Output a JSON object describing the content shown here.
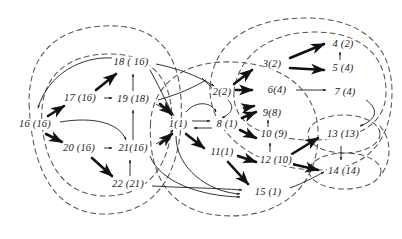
{
  "figure": {
    "width": 402,
    "height": 239,
    "background_color": "#ffffff",
    "stroke_color": "#1a1a1a",
    "dashed_color": "#555555"
  },
  "nodes": [
    {
      "id": "1",
      "label": "1(1)",
      "x": 178,
      "y": 124
    },
    {
      "id": "2",
      "label": "2(2)",
      "x": 222,
      "y": 92
    },
    {
      "id": "3",
      "label": "3(2)",
      "x": 272,
      "y": 64
    },
    {
      "id": "4",
      "label": "4 (2)",
      "x": 343,
      "y": 44
    },
    {
      "id": "5",
      "label": "5 (4)",
      "x": 343,
      "y": 68
    },
    {
      "id": "6",
      "label": "6(4)",
      "x": 277,
      "y": 90
    },
    {
      "id": "7",
      "label": "7 (4)",
      "x": 345,
      "y": 92
    },
    {
      "id": "8",
      "label": "8 (1)",
      "x": 227,
      "y": 124
    },
    {
      "id": "9",
      "label": "9(8)",
      "x": 272,
      "y": 113
    },
    {
      "id": "10",
      "label": "10 (9)",
      "x": 274,
      "y": 134
    },
    {
      "id": "11",
      "label": "11(1)",
      "x": 222,
      "y": 152
    },
    {
      "id": "12",
      "label": "12 (10)",
      "x": 276,
      "y": 160
    },
    {
      "id": "13",
      "label": "13  (13)",
      "x": 343,
      "y": 134
    },
    {
      "id": "14",
      "label": "14 (14)",
      "x": 344,
      "y": 171
    },
    {
      "id": "15",
      "label": "15 (1)",
      "x": 268,
      "y": 192
    },
    {
      "id": "16",
      "label": "16 (16)",
      "x": 35,
      "y": 124
    },
    {
      "id": "17",
      "label": "17 (16)",
      "x": 80,
      "y": 98
    },
    {
      "id": "18",
      "label": "18 ( 16)",
      "x": 131,
      "y": 62
    },
    {
      "id": "19",
      "label": "19 (18)",
      "x": 133,
      "y": 99
    },
    {
      "id": "20",
      "label": "20 (16)",
      "x": 79,
      "y": 148
    },
    {
      "id": "21",
      "label": "21(16)",
      "x": 133,
      "y": 148
    },
    {
      "id": "22",
      "label": "22 (21)",
      "x": 128,
      "y": 184
    }
  ],
  "edges_bold": [
    {
      "from": "16",
      "to": "17"
    },
    {
      "from": "17",
      "to": "18"
    },
    {
      "from": "16",
      "to": "20"
    },
    {
      "from": "20",
      "to": "22"
    },
    {
      "from": "3",
      "to": "4"
    },
    {
      "from": "3",
      "to": "5"
    },
    {
      "from": "2",
      "to": "3"
    },
    {
      "from": "8",
      "to": "9"
    },
    {
      "from": "8",
      "to": "10"
    },
    {
      "from": "1",
      "to": "11"
    },
    {
      "from": "11",
      "to": "12"
    },
    {
      "from": "11",
      "to": "15"
    },
    {
      "from": "12",
      "to": "13"
    },
    {
      "from": "12",
      "to": "14"
    }
  ],
  "edges_thin": [
    {
      "from": "17",
      "to": "19"
    },
    {
      "from": "20",
      "to": "21"
    },
    {
      "from": "21",
      "to": "19"
    },
    {
      "from": "19",
      "to": "18"
    },
    {
      "from": "22",
      "to": "21"
    },
    {
      "from": "6",
      "to": "7"
    },
    {
      "from": "5",
      "to": "4"
    },
    {
      "from": "10",
      "to": "9"
    },
    {
      "from": "12",
      "to": "10"
    },
    {
      "from": "1",
      "to": "8"
    },
    {
      "from": "8",
      "to": "1"
    },
    {
      "from": "13",
      "to": "14"
    }
  ],
  "regions": [
    {
      "name": "left-outer-region",
      "shape": "dashed-ellipse"
    },
    {
      "name": "left-inner-region",
      "shape": "dashed-ellipse"
    },
    {
      "name": "center-region",
      "shape": "dashed-ellipse"
    },
    {
      "name": "right-outer-region",
      "shape": "dashed-ellipse"
    },
    {
      "name": "right-inner-region",
      "shape": "dashed-ellipse"
    },
    {
      "name": "node-13-region",
      "shape": "dashed-ellipse"
    },
    {
      "name": "node-14-region",
      "shape": "dashed-ellipse"
    }
  ]
}
